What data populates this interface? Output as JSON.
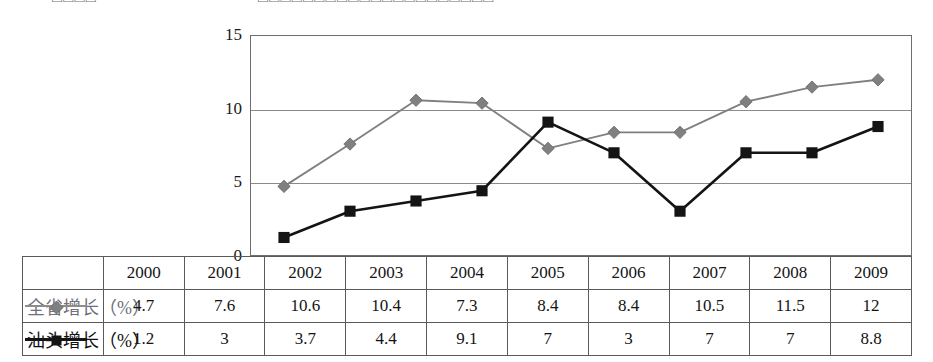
{
  "page": {
    "top_fragment_left": "□□□□",
    "top_fragment_right": "□□□□□□□□□□□□□□□□□□□□□"
  },
  "colors": {
    "province_series": "#808080",
    "shantou_series": "#141414",
    "grid": "#8a8a8a",
    "axis": "#6e6e6e",
    "table_border": "#5a5a5a"
  },
  "chart_data": {
    "type": "line",
    "title": "",
    "xlabel": "",
    "ylabel": "",
    "categories": [
      "2000",
      "2001",
      "2002",
      "2003",
      "2004",
      "2005",
      "2006",
      "2007",
      "2008",
      "2009"
    ],
    "ylim": [
      0,
      15
    ],
    "yticks": [
      0,
      5,
      10,
      15
    ],
    "ytick_labels": [
      "0",
      "5",
      "10",
      "15"
    ],
    "grid": true,
    "gridlines_at": [
      5,
      10
    ],
    "legend_position": "table-left-column",
    "series": [
      {
        "name": "全省增长（%）",
        "marker": "diamond",
        "color": "#808080",
        "values": [
          4.7,
          7.6,
          10.6,
          10.4,
          7.3,
          8.4,
          8.4,
          10.5,
          11.5,
          12
        ],
        "value_labels": [
          "4.7",
          "7.6",
          "10.6",
          "10.4",
          "7.3",
          "8.4",
          "8.4",
          "10.5",
          "11.5",
          "12"
        ]
      },
      {
        "name": "汕头增长（%）",
        "marker": "square",
        "color": "#141414",
        "values": [
          1.2,
          3,
          3.7,
          4.4,
          9.1,
          7,
          3,
          7,
          7,
          8.8
        ],
        "value_labels": [
          "1.2",
          "3",
          "3.7",
          "4.4",
          "9.1",
          "7",
          "3",
          "7",
          "7",
          "8.8"
        ]
      }
    ]
  }
}
